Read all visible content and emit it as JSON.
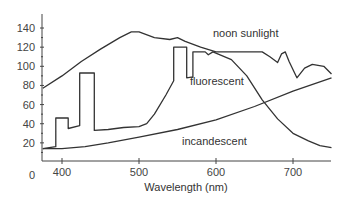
{
  "chart_data": {
    "type": "line",
    "title": "",
    "xlabel": "Wavelength (nm)",
    "ylabel": "",
    "xlim": [
      375,
      750
    ],
    "ylim": [
      0,
      150
    ],
    "grid": false,
    "legend": "inline labels",
    "x_ticks": [
      400,
      500,
      600,
      700
    ],
    "y_ticks": [
      0,
      20,
      40,
      60,
      80,
      100,
      120,
      140
    ],
    "series": [
      {
        "name": "noon sunlight",
        "points": [
          [
            375,
            77
          ],
          [
            400,
            90
          ],
          [
            425,
            105
          ],
          [
            450,
            118
          ],
          [
            475,
            130
          ],
          [
            490,
            136
          ],
          [
            500,
            136
          ],
          [
            520,
            130
          ],
          [
            540,
            128
          ],
          [
            550,
            130
          ],
          [
            560,
            126
          ],
          [
            580,
            120
          ],
          [
            600,
            115
          ],
          [
            640,
            115
          ],
          [
            660,
            115
          ],
          [
            670,
            110
          ],
          [
            680,
            104
          ],
          [
            685,
            113
          ],
          [
            690,
            115
          ],
          [
            695,
            105
          ],
          [
            705,
            88
          ],
          [
            715,
            98
          ],
          [
            725,
            102
          ],
          [
            740,
            100
          ],
          [
            750,
            92
          ]
        ]
      },
      {
        "name": "fluorescent",
        "points": [
          [
            375,
            14
          ],
          [
            392,
            16
          ],
          [
            392,
            46
          ],
          [
            408,
            46
          ],
          [
            408,
            35
          ],
          [
            423,
            38
          ],
          [
            423,
            93
          ],
          [
            442,
            93
          ],
          [
            442,
            33
          ],
          [
            460,
            34
          ],
          [
            480,
            36
          ],
          [
            500,
            37
          ],
          [
            510,
            40
          ],
          [
            520,
            50
          ],
          [
            535,
            70
          ],
          [
            545,
            85
          ],
          [
            545,
            120
          ],
          [
            562,
            120
          ],
          [
            562,
            88
          ],
          [
            570,
            89
          ],
          [
            570,
            115
          ],
          [
            586,
            115
          ],
          [
            590,
            112
          ],
          [
            596,
            115
          ],
          [
            620,
            107
          ],
          [
            640,
            90
          ],
          [
            660,
            65
          ],
          [
            680,
            45
          ],
          [
            700,
            30
          ],
          [
            720,
            22
          ],
          [
            735,
            17
          ],
          [
            750,
            15
          ]
        ]
      },
      {
        "name": "incandescent",
        "points": [
          [
            375,
            14
          ],
          [
            400,
            14
          ],
          [
            430,
            16
          ],
          [
            460,
            20
          ],
          [
            500,
            26
          ],
          [
            550,
            34
          ],
          [
            600,
            44
          ],
          [
            650,
            58
          ],
          [
            700,
            74
          ],
          [
            750,
            88
          ]
        ]
      }
    ],
    "annotations": [
      {
        "text": "noon sunlight",
        "x": 640,
        "y": 130
      },
      {
        "text": "fluorescent",
        "x": 600,
        "y": 90
      },
      {
        "text": "incandescent",
        "x": 595,
        "y": 42
      }
    ]
  },
  "labels": {
    "xlabel": "Wavelength (nm)",
    "x_ticks": [
      "400",
      "500",
      "600",
      "700"
    ],
    "y_ticks": [
      "0",
      "20",
      "40",
      "60",
      "80",
      "100",
      "120",
      "140"
    ],
    "noon": "noon sunlight",
    "fluor": "fluorescent",
    "incand": "incandescent"
  }
}
